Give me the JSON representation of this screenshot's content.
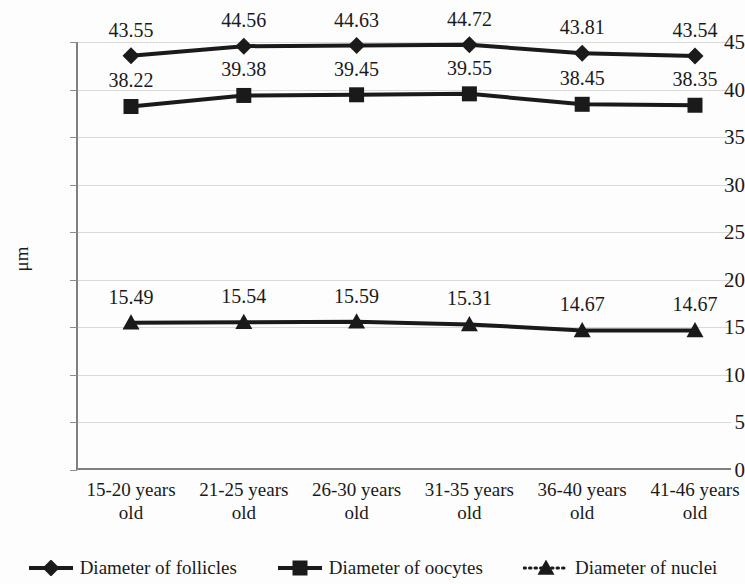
{
  "chart_data": {
    "type": "line",
    "title": "",
    "xlabel": "",
    "ylabel": "μm",
    "ylim": [
      0,
      45
    ],
    "ytick_step": 5,
    "grid": true,
    "legend_position": "bottom",
    "categories": [
      "15-20 years old",
      "21-25 years old",
      "26-30 years old",
      "31-35 years old",
      "36-40 years old",
      "41-46 years old"
    ],
    "category_lines": [
      [
        "15-20 years",
        "old"
      ],
      [
        "21-25 years",
        "old"
      ],
      [
        "26-30 years",
        "old"
      ],
      [
        "31-35 years",
        "old"
      ],
      [
        "36-40 years",
        "old"
      ],
      [
        "41-46 years",
        "old"
      ]
    ],
    "yticks": [
      "0",
      "5",
      "10",
      "15",
      "20",
      "25",
      "30",
      "35",
      "40",
      "45"
    ],
    "ytick_values": [
      0,
      5,
      10,
      15,
      20,
      25,
      30,
      35,
      40,
      45
    ],
    "series": [
      {
        "name": "Diameter of follicles",
        "marker": "diamond",
        "line_style": "solid",
        "color": "#1a1a1a",
        "values": [
          43.55,
          44.56,
          44.63,
          44.72,
          43.81,
          43.54
        ],
        "labels": [
          "43.55",
          "44.56",
          "44.63",
          "44.72",
          "43.81",
          "43.54"
        ]
      },
      {
        "name": "Diameter of oocytes",
        "marker": "square",
        "line_style": "solid",
        "color": "#1a1a1a",
        "values": [
          38.22,
          39.38,
          39.45,
          39.55,
          38.45,
          38.35
        ],
        "labels": [
          "38.22",
          "39.38",
          "39.45",
          "39.55",
          "38.45",
          "38.35"
        ]
      },
      {
        "name": "Diameter of nuclei",
        "marker": "triangle",
        "line_style": "dotted",
        "color": "#1a1a1a",
        "values": [
          15.49,
          15.54,
          15.59,
          15.31,
          14.67,
          14.67
        ],
        "labels": [
          "15.49",
          "15.54",
          "15.59",
          "15.31",
          "14.67",
          "14.67"
        ]
      }
    ]
  },
  "legend": {
    "items": [
      {
        "label": "Diameter of follicles",
        "marker": "diamond-marker-icon",
        "style": "solid"
      },
      {
        "label": "Diameter of oocytes",
        "marker": "square-marker-icon",
        "style": "solid"
      },
      {
        "label": "Diameter of nuclei",
        "marker": "triangle-marker-icon",
        "style": "dotted"
      }
    ]
  },
  "colors": {
    "series": "#1a1a1a",
    "gridline": "#d9d9d9",
    "axis": "#808080",
    "background": "#fdfdfd"
  }
}
